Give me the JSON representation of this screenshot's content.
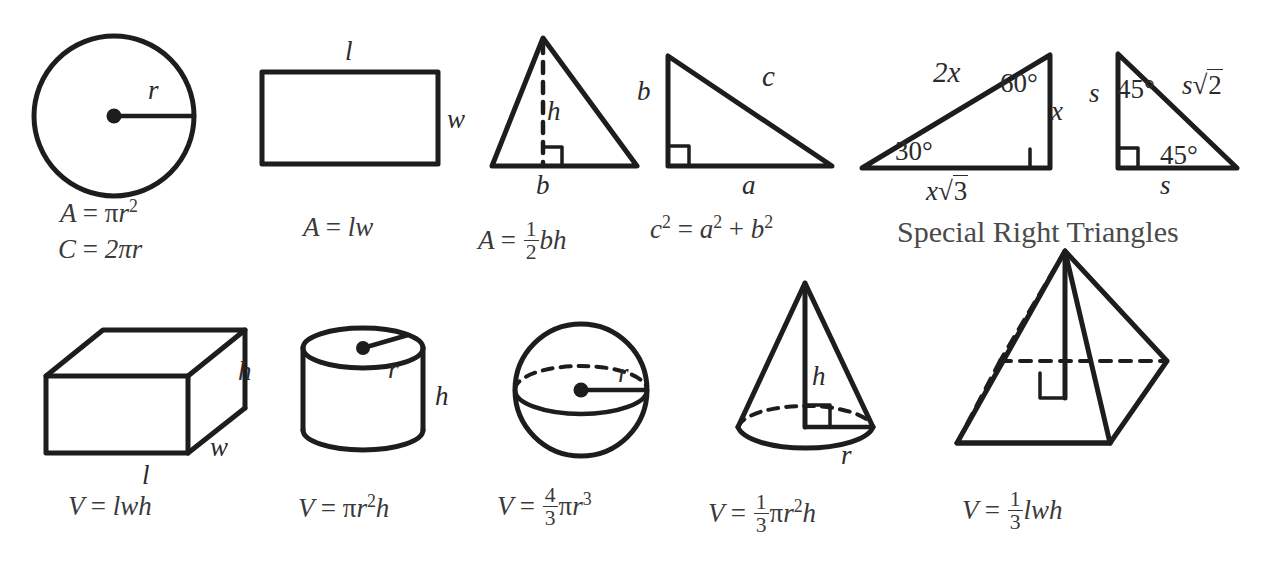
{
  "sheet": {
    "title_text": "Special Right Triangles",
    "ink_color": "#1d1d1d",
    "text_color": "#3a3a3a",
    "background": "#ffffff"
  },
  "figures": {
    "circle": {
      "name": "circle",
      "radius_label": "r",
      "area_formula_lhs": "A",
      "area_formula_eq": "=",
      "area_formula_rhs_pi": "π",
      "area_formula_rhs_var": "r",
      "area_formula_rhs_exp": "2",
      "circumference_lhs": "C",
      "circumference_eq": "=",
      "circumference_rhs": "2πr"
    },
    "rectangle": {
      "name": "rectangle",
      "length_label": "l",
      "width_label": "w",
      "formula_lhs": "A",
      "formula_eq": "=",
      "formula_rhs": "lw"
    },
    "triangle": {
      "name": "triangle",
      "height_label": "h",
      "base_label": "b",
      "formula_lhs": "A",
      "formula_eq": "=",
      "formula_num": "1",
      "formula_den": "2",
      "formula_rhs": "bh"
    },
    "right_triangle": {
      "name": "right-triangle",
      "leg_b_label": "b",
      "leg_a_label": "a",
      "hypotenuse_label": "c",
      "formula_c": "c",
      "formula_c_exp": "2",
      "formula_eq": "=",
      "formula_a": "a",
      "formula_a_exp": "2",
      "formula_plus": "+",
      "formula_b": "b",
      "formula_b_exp": "2"
    },
    "triangle_30_60_90": {
      "name": "30-60-90-triangle",
      "hypotenuse_label": "2x",
      "angle_30": "30°",
      "angle_60": "60°",
      "short_leg_label": "x",
      "long_leg_var": "x",
      "long_leg_radical": "√",
      "long_leg_radicand": "3"
    },
    "triangle_45_45_90": {
      "name": "45-45-90-triangle",
      "leg_left_label": "s",
      "leg_bottom_label": "s",
      "angle_top": "45°",
      "angle_bottom": "45°",
      "hypotenuse_var": "s",
      "hypotenuse_radical": "√",
      "hypotenuse_radicand": "2"
    },
    "rectangular_prism": {
      "name": "rectangular-prism",
      "height_label": "h",
      "width_label": "w",
      "length_label": "l",
      "formula_lhs": "V",
      "formula_eq": "=",
      "formula_rhs": "lwh"
    },
    "cylinder": {
      "name": "cylinder",
      "radius_label": "r",
      "height_label": "h",
      "formula_lhs": "V",
      "formula_eq": "=",
      "formula_pi": "π",
      "formula_r": "r",
      "formula_r_exp": "2",
      "formula_h": "h"
    },
    "sphere": {
      "name": "sphere",
      "radius_label": "r",
      "formula_lhs": "V",
      "formula_eq": "=",
      "formula_num": "4",
      "formula_den": "3",
      "formula_pi": "π",
      "formula_r": "r",
      "formula_r_exp": "3"
    },
    "cone": {
      "name": "cone",
      "height_label": "h",
      "radius_label": "r",
      "formula_lhs": "V",
      "formula_eq": "=",
      "formula_num": "1",
      "formula_den": "3",
      "formula_pi": "π",
      "formula_r": "r",
      "formula_r_exp": "2",
      "formula_h": "h"
    },
    "pyramid": {
      "name": "pyramid",
      "formula_lhs": "V",
      "formula_eq": "=",
      "formula_num": "1",
      "formula_den": "3",
      "formula_rhs": "lwh"
    }
  }
}
